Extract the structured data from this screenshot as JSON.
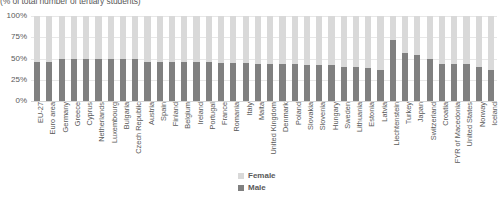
{
  "chart_data": {
    "type": "bar",
    "subtype": "stacked-100-percent",
    "title": "(% of total number of tertiary students)",
    "xlabel": "",
    "ylabel": "",
    "ylim": [
      0,
      100
    ],
    "ytick_labels": [
      "100%",
      "75%",
      "50%",
      "25%",
      "0%"
    ],
    "ytick_values": [
      100,
      75,
      50,
      25,
      0
    ],
    "grid": true,
    "legend_position": "bottom-center",
    "categories": [
      "EU-27",
      "Euro area",
      "Germany",
      "Greece",
      "Cyprus",
      "Netherlands",
      "Luxembourg",
      "Bulgaria",
      "Czech Republic",
      "Austria",
      "Spain",
      "Finland",
      "Belgium",
      "Ireland",
      "Portugal",
      "France",
      "Romania",
      "Italy",
      "Malta",
      "United Kingdom",
      "Denmark",
      "Poland",
      "Slovakia",
      "Slovenia",
      "Hungary",
      "Sweden",
      "Lithuania",
      "Estonia",
      "Latvia",
      "Liechtenstein",
      "Turkey",
      "Japan",
      "Switzerland",
      "Croatia",
      "FYR of Macedonia",
      "United States",
      "Norway",
      "Iceland"
    ],
    "series": [
      {
        "name": "Female",
        "color": "#d9d9d9",
        "values": [
          54,
          54,
          50,
          50,
          50,
          50,
          50,
          50,
          50,
          54,
          54,
          54,
          54,
          54,
          54,
          55,
          55,
          55,
          56,
          56,
          57,
          57,
          58,
          58,
          58,
          60,
          60,
          61,
          63,
          28,
          44,
          46,
          50,
          56,
          56,
          57,
          60,
          64
        ]
      },
      {
        "name": "Male",
        "color": "#808080",
        "values": [
          46,
          46,
          50,
          50,
          50,
          50,
          50,
          50,
          50,
          46,
          46,
          46,
          46,
          46,
          46,
          45,
          45,
          45,
          44,
          44,
          43,
          43,
          42,
          42,
          42,
          40,
          40,
          39,
          37,
          72,
          56,
          54,
          50,
          44,
          44,
          43,
          40,
          36
        ]
      }
    ]
  },
  "legend": {
    "items": [
      {
        "label": "Female",
        "swatch": "female"
      },
      {
        "label": "Male",
        "swatch": "male"
      }
    ]
  }
}
